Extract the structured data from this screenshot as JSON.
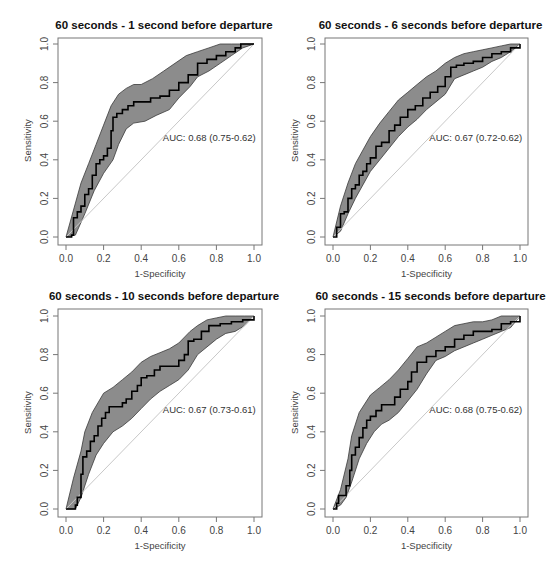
{
  "figure": {
    "layout": "2x2 grid of ROC curves"
  },
  "chart_data": [
    {
      "type": "line",
      "title": "60 seconds - 1 second before departure",
      "xlabel": "1-Specificity",
      "ylabel": "Sensitivity",
      "xlim": [
        0,
        1
      ],
      "ylim": [
        0,
        1
      ],
      "xticks": [
        "0.0",
        "0.2",
        "0.4",
        "0.6",
        "0.8",
        "1.0"
      ],
      "yticks": [
        "0.0",
        "0.2",
        "0.4",
        "0.6",
        "0.8",
        "1.0"
      ],
      "annotation": "AUC: 0.68 (0.75-0.62)",
      "auc": 0.68,
      "auc_ci": [
        0.62,
        0.75
      ],
      "reference_line": "diagonal",
      "series": [
        {
          "name": "ROC",
          "x": [
            0.0,
            0.02,
            0.03,
            0.04,
            0.06,
            0.08,
            0.1,
            0.12,
            0.14,
            0.16,
            0.18,
            0.2,
            0.22,
            0.24,
            0.25,
            0.27,
            0.3,
            0.33,
            0.36,
            0.4,
            0.45,
            0.5,
            0.55,
            0.6,
            0.65,
            0.7,
            0.75,
            0.8,
            0.85,
            0.9,
            0.93,
            0.96,
            1.0
          ],
          "y": [
            0.0,
            0.0,
            0.01,
            0.1,
            0.13,
            0.16,
            0.22,
            0.25,
            0.32,
            0.38,
            0.4,
            0.42,
            0.46,
            0.55,
            0.62,
            0.64,
            0.66,
            0.68,
            0.7,
            0.7,
            0.72,
            0.73,
            0.76,
            0.8,
            0.84,
            0.9,
            0.92,
            0.94,
            0.96,
            0.98,
            1.0,
            1.0,
            1.0
          ]
        },
        {
          "name": "CI upper",
          "x": [
            0.0,
            0.04,
            0.08,
            0.12,
            0.16,
            0.2,
            0.24,
            0.28,
            0.32,
            0.36,
            0.4,
            0.46,
            0.52,
            0.58,
            0.64,
            0.7,
            0.76,
            0.82,
            0.88,
            0.94,
            1.0
          ],
          "y": [
            0.0,
            0.14,
            0.28,
            0.38,
            0.48,
            0.58,
            0.68,
            0.74,
            0.77,
            0.79,
            0.79,
            0.82,
            0.86,
            0.9,
            0.94,
            0.96,
            0.98,
            1.0,
            1.0,
            1.0,
            1.0
          ]
        },
        {
          "name": "CI lower",
          "x": [
            0.0,
            0.05,
            0.1,
            0.15,
            0.2,
            0.25,
            0.28,
            0.32,
            0.36,
            0.42,
            0.48,
            0.55,
            0.6,
            0.66,
            0.7,
            0.76,
            0.82,
            0.88,
            0.94,
            1.0
          ],
          "y": [
            0.0,
            0.01,
            0.12,
            0.24,
            0.33,
            0.4,
            0.48,
            0.56,
            0.59,
            0.6,
            0.63,
            0.66,
            0.72,
            0.78,
            0.83,
            0.86,
            0.9,
            0.94,
            0.98,
            1.0
          ]
        }
      ]
    },
    {
      "type": "line",
      "title": "60 seconds - 6 seconds before departure",
      "xlabel": "1-Specificity",
      "ylabel": "Sensitivity",
      "xlim": [
        0,
        1
      ],
      "ylim": [
        0,
        1
      ],
      "xticks": [
        "0.0",
        "0.2",
        "0.4",
        "0.6",
        "0.8",
        "1.0"
      ],
      "yticks": [
        "0.0",
        "0.2",
        "0.4",
        "0.6",
        "0.8",
        "1.0"
      ],
      "annotation": "AUC: 0.67 (0.72-0.62)",
      "auc": 0.67,
      "auc_ci": [
        0.62,
        0.72
      ],
      "reference_line": "diagonal",
      "series": [
        {
          "name": "ROC",
          "x": [
            0.0,
            0.02,
            0.04,
            0.06,
            0.08,
            0.1,
            0.12,
            0.14,
            0.16,
            0.18,
            0.2,
            0.23,
            0.26,
            0.3,
            0.33,
            0.36,
            0.4,
            0.44,
            0.48,
            0.52,
            0.56,
            0.6,
            0.63,
            0.66,
            0.7,
            0.75,
            0.8,
            0.85,
            0.9,
            0.95,
            1.0
          ],
          "y": [
            0.0,
            0.05,
            0.12,
            0.13,
            0.2,
            0.25,
            0.27,
            0.32,
            0.34,
            0.38,
            0.41,
            0.47,
            0.49,
            0.55,
            0.58,
            0.62,
            0.66,
            0.68,
            0.72,
            0.75,
            0.78,
            0.83,
            0.88,
            0.89,
            0.9,
            0.91,
            0.93,
            0.95,
            0.96,
            0.98,
            1.0
          ]
        },
        {
          "name": "CI upper",
          "x": [
            0.0,
            0.04,
            0.08,
            0.12,
            0.16,
            0.2,
            0.25,
            0.3,
            0.35,
            0.4,
            0.45,
            0.5,
            0.55,
            0.6,
            0.65,
            0.7,
            0.75,
            0.8,
            0.85,
            0.9,
            0.95,
            1.0
          ],
          "y": [
            0.0,
            0.16,
            0.28,
            0.38,
            0.45,
            0.52,
            0.59,
            0.65,
            0.71,
            0.75,
            0.79,
            0.83,
            0.86,
            0.9,
            0.93,
            0.95,
            0.96,
            0.97,
            0.98,
            0.99,
            1.0,
            1.0
          ]
        },
        {
          "name": "CI lower",
          "x": [
            0.0,
            0.04,
            0.08,
            0.12,
            0.16,
            0.2,
            0.25,
            0.3,
            0.35,
            0.4,
            0.45,
            0.5,
            0.55,
            0.6,
            0.65,
            0.7,
            0.75,
            0.8,
            0.85,
            0.9,
            0.95,
            1.0
          ],
          "y": [
            0.0,
            0.03,
            0.12,
            0.2,
            0.27,
            0.34,
            0.4,
            0.46,
            0.52,
            0.57,
            0.61,
            0.66,
            0.7,
            0.74,
            0.82,
            0.84,
            0.86,
            0.88,
            0.91,
            0.93,
            0.96,
            1.0
          ]
        }
      ]
    },
    {
      "type": "line",
      "title": "60 seconds - 10 seconds before departure",
      "xlabel": "1-Specificity",
      "ylabel": "Sensitivity",
      "xlim": [
        0,
        1
      ],
      "ylim": [
        0,
        1
      ],
      "xticks": [
        "0.0",
        "0.2",
        "0.4",
        "0.6",
        "0.8",
        "1.0"
      ],
      "yticks": [
        "0.0",
        "0.2",
        "0.4",
        "0.6",
        "0.8",
        "1.0"
      ],
      "annotation": "AUC: 0.67 (0.73-0.61)",
      "auc": 0.67,
      "auc_ci": [
        0.61,
        0.73
      ],
      "reference_line": "diagonal",
      "series": [
        {
          "name": "ROC",
          "x": [
            0.0,
            0.03,
            0.05,
            0.06,
            0.08,
            0.09,
            0.11,
            0.13,
            0.15,
            0.17,
            0.19,
            0.21,
            0.23,
            0.26,
            0.3,
            0.32,
            0.35,
            0.38,
            0.4,
            0.43,
            0.47,
            0.5,
            0.55,
            0.6,
            0.63,
            0.65,
            0.68,
            0.72,
            0.76,
            0.82,
            0.88,
            0.94,
            1.0
          ],
          "y": [
            0.0,
            0.0,
            0.02,
            0.06,
            0.18,
            0.27,
            0.3,
            0.35,
            0.38,
            0.43,
            0.47,
            0.5,
            0.53,
            0.53,
            0.55,
            0.57,
            0.61,
            0.64,
            0.68,
            0.69,
            0.72,
            0.74,
            0.74,
            0.77,
            0.8,
            0.87,
            0.88,
            0.92,
            0.95,
            0.96,
            0.97,
            0.98,
            1.0
          ]
        },
        {
          "name": "CI upper",
          "x": [
            0.0,
            0.04,
            0.08,
            0.1,
            0.14,
            0.2,
            0.25,
            0.3,
            0.35,
            0.4,
            0.45,
            0.5,
            0.55,
            0.6,
            0.66,
            0.7,
            0.75,
            0.8,
            0.85,
            0.9,
            0.95,
            1.0
          ],
          "y": [
            0.0,
            0.16,
            0.3,
            0.4,
            0.5,
            0.6,
            0.63,
            0.67,
            0.71,
            0.76,
            0.79,
            0.81,
            0.83,
            0.86,
            0.92,
            0.95,
            0.98,
            0.99,
            1.0,
            1.0,
            1.0,
            1.0
          ]
        },
        {
          "name": "CI lower",
          "x": [
            0.0,
            0.05,
            0.08,
            0.12,
            0.16,
            0.2,
            0.25,
            0.3,
            0.35,
            0.4,
            0.45,
            0.5,
            0.55,
            0.6,
            0.65,
            0.7,
            0.75,
            0.8,
            0.85,
            0.9,
            0.95,
            1.0
          ],
          "y": [
            0.0,
            0.0,
            0.06,
            0.18,
            0.28,
            0.34,
            0.4,
            0.43,
            0.47,
            0.52,
            0.57,
            0.61,
            0.64,
            0.67,
            0.72,
            0.8,
            0.84,
            0.88,
            0.91,
            0.92,
            0.95,
            1.0
          ]
        }
      ]
    },
    {
      "type": "line",
      "title": "60 seconds - 15 seconds before departure",
      "xlabel": "1-Specificity",
      "ylabel": "Sensitivity",
      "xlim": [
        0,
        1
      ],
      "ylim": [
        0,
        1
      ],
      "xticks": [
        "0.0",
        "0.2",
        "0.4",
        "0.6",
        "0.8",
        "1.0"
      ],
      "yticks": [
        "0.0",
        "0.2",
        "0.4",
        "0.6",
        "0.8",
        "1.0"
      ],
      "annotation": "AUC: 0.68 (0.75-0.62)",
      "auc": 0.68,
      "auc_ci": [
        0.62,
        0.75
      ],
      "reference_line": "diagonal",
      "series": [
        {
          "name": "ROC",
          "x": [
            0.0,
            0.02,
            0.03,
            0.06,
            0.07,
            0.09,
            0.1,
            0.12,
            0.14,
            0.16,
            0.18,
            0.2,
            0.23,
            0.26,
            0.3,
            0.33,
            0.36,
            0.4,
            0.42,
            0.45,
            0.5,
            0.55,
            0.6,
            0.65,
            0.7,
            0.75,
            0.8,
            0.85,
            0.9,
            0.95,
            1.0
          ],
          "y": [
            0.0,
            0.03,
            0.07,
            0.07,
            0.12,
            0.2,
            0.28,
            0.32,
            0.37,
            0.42,
            0.46,
            0.48,
            0.51,
            0.54,
            0.54,
            0.58,
            0.62,
            0.66,
            0.71,
            0.76,
            0.79,
            0.82,
            0.84,
            0.88,
            0.9,
            0.92,
            0.92,
            0.93,
            0.96,
            0.97,
            1.0
          ]
        },
        {
          "name": "CI upper",
          "x": [
            0.0,
            0.04,
            0.08,
            0.1,
            0.14,
            0.2,
            0.25,
            0.3,
            0.35,
            0.4,
            0.45,
            0.5,
            0.55,
            0.6,
            0.65,
            0.7,
            0.75,
            0.8,
            0.85,
            0.9,
            0.95,
            1.0
          ],
          "y": [
            0.0,
            0.1,
            0.26,
            0.38,
            0.5,
            0.59,
            0.63,
            0.67,
            0.72,
            0.78,
            0.84,
            0.86,
            0.89,
            0.92,
            0.95,
            0.96,
            0.97,
            0.97,
            0.98,
            1.0,
            1.0,
            1.0
          ]
        },
        {
          "name": "CI lower",
          "x": [
            0.0,
            0.04,
            0.07,
            0.1,
            0.14,
            0.18,
            0.22,
            0.26,
            0.3,
            0.35,
            0.4,
            0.45,
            0.5,
            0.55,
            0.6,
            0.65,
            0.7,
            0.75,
            0.8,
            0.85,
            0.9,
            0.95,
            1.0
          ],
          "y": [
            0.0,
            0.02,
            0.06,
            0.14,
            0.26,
            0.34,
            0.4,
            0.44,
            0.46,
            0.5,
            0.56,
            0.62,
            0.7,
            0.77,
            0.79,
            0.82,
            0.84,
            0.86,
            0.88,
            0.9,
            0.92,
            0.94,
            1.0
          ]
        }
      ]
    }
  ],
  "panels": [
    {
      "left": 58,
      "top": 38,
      "x0": 66,
      "x1": 254,
      "y0": 237,
      "y1": 44,
      "right": 262,
      "bottom": 245
    },
    {
      "left": 325,
      "top": 38,
      "x0": 333,
      "x1": 520,
      "y0": 237,
      "y1": 44,
      "right": 528,
      "bottom": 245
    },
    {
      "left": 58,
      "top": 309,
      "x0": 66,
      "x1": 254,
      "y0": 509,
      "y1": 316,
      "right": 262,
      "bottom": 517
    },
    {
      "left": 325,
      "top": 309,
      "x0": 333,
      "x1": 520,
      "y0": 509,
      "y1": 316,
      "right": 528,
      "bottom": 517
    }
  ],
  "colors": {
    "band_fill": "#8c8c8c",
    "band_stroke": "#3a3a3a",
    "curve": "#000000",
    "diagonal": "#c8c8c8",
    "frame": "#777777",
    "text": "#444444",
    "title": "#111111"
  }
}
